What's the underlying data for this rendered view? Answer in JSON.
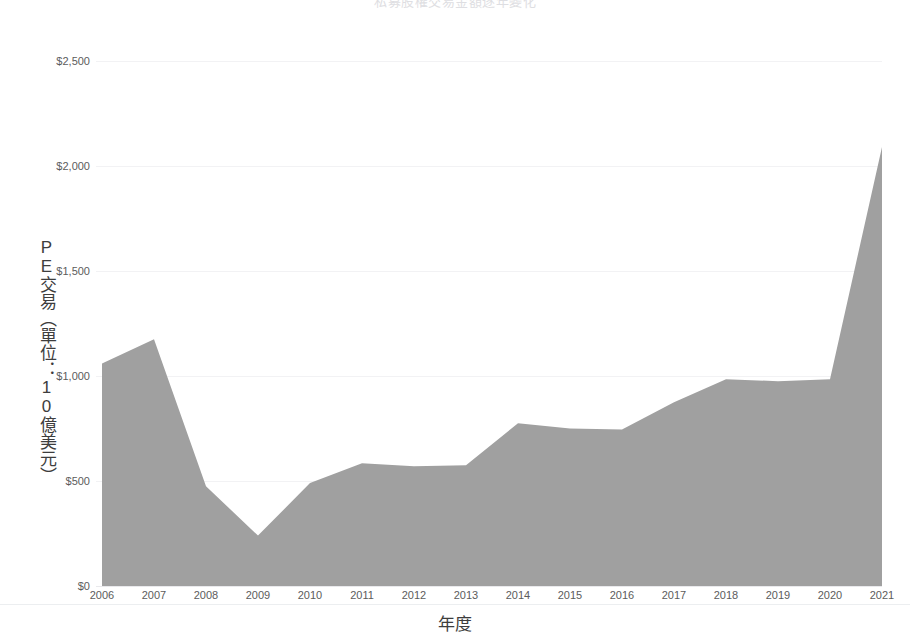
{
  "chart_data": {
    "type": "area",
    "title": "",
    "xlabel": "年度",
    "ylabel": "PE交易（單位：10億美元）",
    "categories": [
      "2006",
      "2007",
      "2008",
      "2009",
      "2010",
      "2011",
      "2012",
      "2013",
      "2014",
      "2015",
      "2016",
      "2017",
      "2018",
      "2019",
      "2020",
      "2021"
    ],
    "values": [
      1060,
      1175,
      475,
      240,
      490,
      585,
      570,
      575,
      775,
      750,
      745,
      875,
      985,
      975,
      985,
      2090
    ],
    "series": [
      {
        "name": "PE交易",
        "values": [
          1060,
          1175,
          475,
          240,
          490,
          585,
          570,
          575,
          775,
          750,
          745,
          875,
          985,
          975,
          985,
          2090
        ]
      }
    ],
    "ylim": [
      0,
      2500
    ],
    "xlim": [
      "2006",
      "2021"
    ],
    "ytick_labels": [
      "$0",
      "$500",
      "$1,000",
      "$1,500",
      "$2,000",
      "$2,500"
    ],
    "ytick_values": [
      0,
      500,
      1000,
      1500,
      2000,
      2500
    ],
    "xtick_labels": [
      "2006",
      "2007",
      "2008",
      "2009",
      "2010",
      "2011",
      "2012",
      "2013",
      "2014",
      "2015",
      "2016",
      "2017",
      "2018",
      "2019",
      "2020",
      "2021"
    ],
    "grid": true,
    "legend": "none",
    "area_color": "#a0a0a0",
    "grid_color": "#f2f2f4",
    "tick_label_color": "#5c5c5c",
    "axis_title_color": "#3d3d3d"
  },
  "axes": {
    "y_title": "PE交易（單位：10億美元）",
    "x_title": "年度",
    "y_ticks": [
      {
        "label": "$2,500",
        "value": 2500
      },
      {
        "label": "$2,000",
        "value": 2000
      },
      {
        "label": "$1,500",
        "value": 1500
      },
      {
        "label": "$1,000",
        "value": 1000
      },
      {
        "label": "$500",
        "value": 500
      },
      {
        "label": "$0",
        "value": 0
      }
    ],
    "x_ticks": [
      {
        "label": "2006"
      },
      {
        "label": "2007"
      },
      {
        "label": "2008"
      },
      {
        "label": "2009"
      },
      {
        "label": "2010"
      },
      {
        "label": "2011"
      },
      {
        "label": "2012"
      },
      {
        "label": "2013"
      },
      {
        "label": "2014"
      },
      {
        "label": "2015"
      },
      {
        "label": "2016"
      },
      {
        "label": "2017"
      },
      {
        "label": "2018"
      },
      {
        "label": "2019"
      },
      {
        "label": "2020"
      },
      {
        "label": "2021"
      }
    ]
  },
  "header": {
    "cropped_title": "私募股權交易金額逐年變化"
  }
}
